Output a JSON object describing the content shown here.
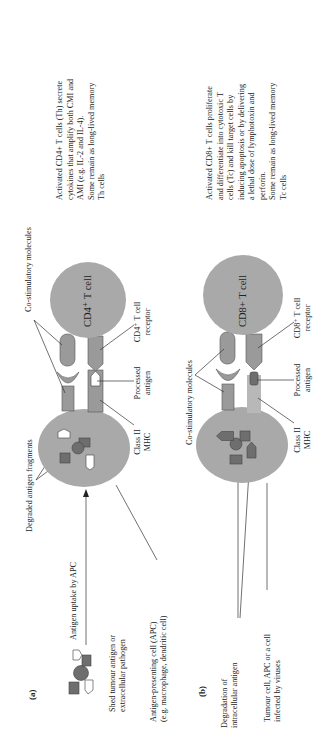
{
  "figure": {
    "orientation": "rotated 90 degrees counter-clockwise (text reads bottom-to-top)",
    "colors": {
      "cell_fill": "#a9a9a9",
      "molecule_fill": "#9a9a9a",
      "antigen_dark": "#6e6e6e",
      "text": "#222222",
      "background": "#ffffff"
    }
  },
  "panel_a": {
    "label": "(a)",
    "source_lines": [
      "Shed tumour antigen or",
      "extracellular pathogen"
    ],
    "apc_lines": [
      "Antigen-presenting cell (APC)",
      "(e.g. macrophage, dendritic cell)"
    ],
    "uptake": "Antigen uptake by APC",
    "fragments": "Degraded antigen fragments",
    "costim": "Co-stimulatory molecules",
    "mhc_lines": [
      "Class II",
      "MHC"
    ],
    "antigen_lines": [
      "Processed",
      "antigen"
    ],
    "receptor_lines": [
      "CD4⁺ T cell",
      "receptor"
    ],
    "tcell": "CD4⁺ T cell",
    "outcome_lines": [
      "Activated CD4+ T cells (Th) secrete",
      "cytokines that amplify both CMI and",
      "AMI (e.g. IL-2 and IL-4).",
      "Some remain as long-lived memory",
      "Th cells"
    ]
  },
  "panel_b": {
    "label": "(b)",
    "degradation_lines": [
      "Degradation of",
      "intracellular antigen"
    ],
    "source_lines": [
      "Tumour cell, APC or a cell",
      "infected by viruses"
    ],
    "costim": "Co-stimulatory molecules",
    "mhc_lines": [
      "Class II",
      "MHC"
    ],
    "antigen_lines": [
      "Processed",
      "antigen"
    ],
    "receptor_lines": [
      "CD8⁺ T cell",
      "receptor"
    ],
    "tcell": "CD8+ T cell",
    "outcome_lines": [
      "Activated CD8+ T cells proliferate",
      "and differentiate into cytotoxic T",
      "cells (Tc) and kill target cells by",
      "inducing apoptosis or by delivering",
      "a lethal dose of lymphotoxin and",
      "perforin.",
      "Some remain as long-lived memory",
      "Tc cells"
    ]
  }
}
